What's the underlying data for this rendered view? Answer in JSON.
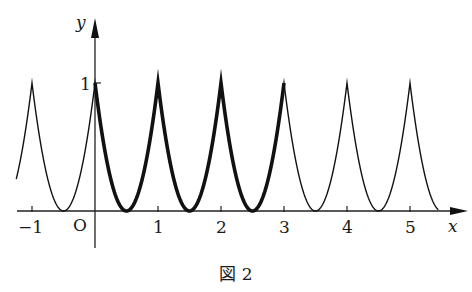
{
  "chart_data": {
    "type": "line",
    "title": "",
    "caption": "図 2",
    "xlabel": "x",
    "ylabel": "y",
    "origin_label": "O",
    "x_ticks": [
      -1,
      1,
      2,
      3,
      4,
      5
    ],
    "x_tick_labels": [
      "−1",
      "1",
      "2",
      "3",
      "4",
      "5"
    ],
    "y_ticks": [
      1
    ],
    "y_tick_labels": [
      "1"
    ],
    "xlim": [
      -1.25,
      5.45
    ],
    "ylim": [
      0,
      1
    ],
    "grid": false,
    "legend": null,
    "series": [
      {
        "name": "curve (thin)",
        "x_range": [
          -1.25,
          5.45
        ],
        "style": "thin"
      },
      {
        "name": "curve (bold, 0 ≤ x ≤ 3)",
        "x_range": [
          0,
          3
        ],
        "style": "bold"
      }
    ],
    "peaks": [
      {
        "x": -1,
        "y": 1
      },
      {
        "x": 0,
        "y": 1
      },
      {
        "x": 1,
        "y": 1
      },
      {
        "x": 2,
        "y": 1
      },
      {
        "x": 3,
        "y": 1
      },
      {
        "x": 4,
        "y": 1
      },
      {
        "x": 5,
        "y": 1
      }
    ],
    "minima": [
      {
        "x": -0.5,
        "y": 0
      },
      {
        "x": 0.5,
        "y": 0
      },
      {
        "x": 1.5,
        "y": 0
      },
      {
        "x": 2.5,
        "y": 0
      },
      {
        "x": 3.5,
        "y": 0
      },
      {
        "x": 4.5,
        "y": 0
      }
    ]
  },
  "labels": {
    "y_axis": "y",
    "x_axis": "x",
    "origin": "O",
    "one_y": "1",
    "ticks": [
      "−1",
      "1",
      "2",
      "3",
      "4",
      "5"
    ],
    "caption": "図 2"
  }
}
